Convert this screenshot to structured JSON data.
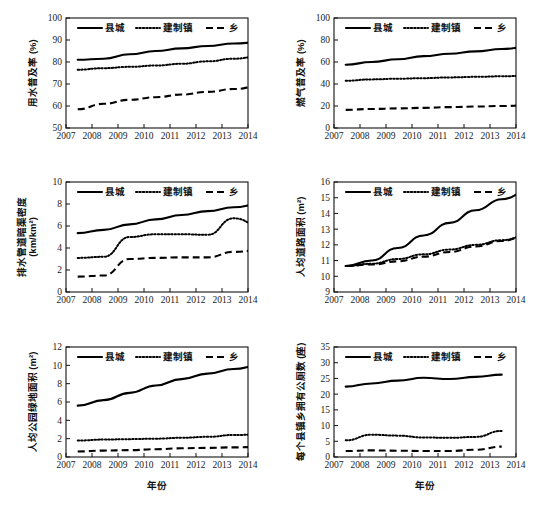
{
  "figure": {
    "title": "",
    "xlabel": "年份",
    "legend": {
      "items": [
        {
          "label": "县城",
          "style": "solid"
        },
        {
          "label": "建制镇",
          "style": "dotted"
        },
        {
          "label": "乡",
          "style": "dashed"
        }
      ]
    }
  },
  "chart_data": [
    {
      "type": "line",
      "panel": "a",
      "title": "",
      "ylabel": "用水普及率 (%)",
      "xlabel": "",
      "x": [
        2007,
        2008,
        2009,
        2010,
        2011,
        2012,
        2013,
        2014
      ],
      "xlim": [
        2007,
        2014
      ],
      "ylim": [
        50,
        100
      ],
      "yticks": [
        50,
        60,
        70,
        80,
        90,
        100
      ],
      "xticks": [
        2007,
        2008,
        2009,
        2010,
        2011,
        2012,
        2013,
        2014
      ],
      "grid": false,
      "legend_position": "top-center",
      "series": [
        {
          "name": "县城",
          "style": "solid",
          "values": [
            81.0,
            81.5,
            83.5,
            85.0,
            86.2,
            87.3,
            88.4,
            89.0
          ]
        },
        {
          "name": "建制镇",
          "style": "dotted",
          "values": [
            76.5,
            77.2,
            77.8,
            78.4,
            79.2,
            80.3,
            81.5,
            82.5
          ]
        },
        {
          "name": "乡",
          "style": "dashed",
          "values": [
            58.5,
            61.0,
            62.8,
            64.0,
            65.2,
            66.4,
            67.7,
            69.0
          ]
        }
      ]
    },
    {
      "type": "line",
      "panel": "b",
      "title": "",
      "ylabel": "燃气普及率 (%)",
      "xlabel": "",
      "x": [
        2007,
        2008,
        2009,
        2010,
        2011,
        2012,
        2013,
        2014
      ],
      "xlim": [
        2007,
        2014
      ],
      "ylim": [
        0,
        100
      ],
      "yticks": [
        0,
        20,
        40,
        60,
        80,
        100
      ],
      "xticks": [
        2007,
        2008,
        2009,
        2010,
        2011,
        2012,
        2013,
        2014
      ],
      "grid": false,
      "legend_position": "top-center",
      "series": [
        {
          "name": "县城",
          "style": "solid",
          "values": [
            57.5,
            60.0,
            62.5,
            65.3,
            67.5,
            69.7,
            71.8,
            73.5
          ]
        },
        {
          "name": "建制镇",
          "style": "dotted",
          "values": [
            43.0,
            44.2,
            44.8,
            45.3,
            46.0,
            46.5,
            47.0,
            47.5
          ]
        },
        {
          "name": "乡",
          "style": "dashed",
          "values": [
            16.5,
            17.3,
            17.8,
            18.3,
            19.0,
            19.5,
            20.0,
            20.5
          ]
        }
      ]
    },
    {
      "type": "line",
      "panel": "c",
      "title": "",
      "ylabel": "排水管道暗渠密度 (km/km²)",
      "xlabel": "",
      "x": [
        2007,
        2008,
        2009,
        2010,
        2011,
        2012,
        2013,
        2014
      ],
      "xlim": [
        2007,
        2014
      ],
      "ylim": [
        0.0,
        10.0
      ],
      "yticks": [
        0.0,
        2.0,
        4.0,
        6.0,
        8.0,
        10.0
      ],
      "xticks": [
        2007,
        2008,
        2009,
        2010,
        2011,
        2012,
        2013,
        2014
      ],
      "grid": false,
      "legend_position": "top-center",
      "series": [
        {
          "name": "县城",
          "style": "solid",
          "values": [
            5.35,
            5.65,
            6.15,
            6.6,
            7.0,
            7.35,
            7.7,
            8.0
          ]
        },
        {
          "name": "建制镇",
          "style": "dotted",
          "values": [
            3.1,
            3.2,
            5.0,
            5.25,
            5.25,
            5.2,
            6.7,
            6.05
          ]
        },
        {
          "name": "乡",
          "style": "dashed",
          "values": [
            1.4,
            1.5,
            3.0,
            3.1,
            3.15,
            3.15,
            3.65,
            3.8
          ]
        }
      ]
    },
    {
      "type": "line",
      "panel": "d",
      "title": "",
      "ylabel": "人均道路面积 (m²)",
      "xlabel": "",
      "x": [
        2007,
        2008,
        2009,
        2010,
        2011,
        2012,
        2013,
        2014
      ],
      "xlim": [
        2007,
        2014
      ],
      "ylim": [
        9,
        16
      ],
      "yticks": [
        9,
        10,
        11,
        12,
        13,
        14,
        15,
        16
      ],
      "xticks": [
        2007,
        2008,
        2009,
        2010,
        2011,
        2012,
        2013,
        2014
      ],
      "grid": false,
      "legend_position": "top-center",
      "series": [
        {
          "name": "县城",
          "style": "solid",
          "values": [
            10.65,
            11.0,
            11.8,
            12.6,
            13.4,
            14.2,
            14.9,
            15.4
          ]
        },
        {
          "name": "建制镇",
          "style": "dotted",
          "values": [
            10.65,
            10.8,
            11.1,
            11.4,
            11.7,
            12.0,
            12.3,
            12.6
          ]
        },
        {
          "name": "乡",
          "style": "dashed",
          "values": [
            10.65,
            10.75,
            10.95,
            11.25,
            11.55,
            11.9,
            12.25,
            12.6
          ]
        }
      ]
    },
    {
      "type": "line",
      "panel": "e",
      "title": "",
      "ylabel": "人均公园绿地面积 (m²)",
      "xlabel": "年份",
      "x": [
        2007,
        2008,
        2009,
        2010,
        2011,
        2012,
        2013,
        2014
      ],
      "xlim": [
        2007,
        2014
      ],
      "ylim": [
        0.0,
        12.0
      ],
      "yticks": [
        0.0,
        2.0,
        4.0,
        6.0,
        8.0,
        10.0,
        12.0
      ],
      "xticks": [
        2007,
        2008,
        2009,
        2010,
        2011,
        2012,
        2013,
        2014
      ],
      "grid": false,
      "legend_position": "top-center",
      "series": [
        {
          "name": "县城",
          "style": "solid",
          "values": [
            5.6,
            6.2,
            7.0,
            7.8,
            8.5,
            9.1,
            9.6,
            10.0
          ]
        },
        {
          "name": "建制镇",
          "style": "dotted",
          "values": [
            1.8,
            1.9,
            1.95,
            2.0,
            2.1,
            2.2,
            2.4,
            2.45
          ]
        },
        {
          "name": "乡",
          "style": "dashed",
          "values": [
            0.6,
            0.7,
            0.75,
            0.85,
            0.95,
            1.0,
            1.05,
            1.1
          ]
        }
      ]
    },
    {
      "type": "line",
      "panel": "f",
      "title": "",
      "ylabel": "每个县镇乡拥有公厕数 (座)",
      "xlabel": "年份",
      "x": [
        2007,
        2008,
        2009,
        2010,
        2011,
        2012,
        2013
      ],
      "xlim": [
        2007,
        2014
      ],
      "ylim": [
        0,
        35
      ],
      "yticks": [
        0,
        5,
        10,
        15,
        20,
        25,
        30,
        35
      ],
      "xticks": [
        2007,
        2008,
        2009,
        2010,
        2011,
        2012,
        2013,
        2014
      ],
      "grid": false,
      "legend_position": "top-center",
      "series": [
        {
          "name": "县城",
          "style": "solid",
          "values": [
            22.4,
            23.4,
            24.3,
            25.2,
            24.8,
            25.5,
            26.2
          ]
        },
        {
          "name": "建制镇",
          "style": "dotted",
          "values": [
            5.3,
            7.1,
            6.8,
            6.2,
            6.1,
            6.4,
            8.3
          ]
        },
        {
          "name": "乡",
          "style": "dashed",
          "values": [
            1.9,
            2.1,
            2.0,
            1.9,
            1.9,
            2.3,
            3.3
          ]
        }
      ]
    }
  ]
}
